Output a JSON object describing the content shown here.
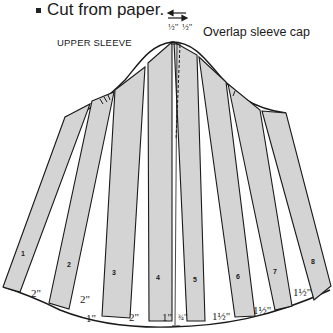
{
  "note": {
    "text": "Cut from paper.",
    "bullet": "square"
  },
  "diagram": {
    "title": "UPPER SLEEVE",
    "overlap_label": "Overlap sleeve cap",
    "overlap_amounts": [
      "½\"",
      "½\""
    ],
    "strip_fill": "#d4d4d4",
    "line_color": "#1a1a1a",
    "strips": [
      {
        "id": "1",
        "label": "1"
      },
      {
        "id": "2",
        "label": "2"
      },
      {
        "id": "3",
        "label": "3"
      },
      {
        "id": "4",
        "label": "4"
      },
      {
        "id": "5",
        "label": "5"
      },
      {
        "id": "6",
        "label": "6"
      },
      {
        "id": "7",
        "label": "7"
      },
      {
        "id": "8",
        "label": "8"
      }
    ],
    "spread_labels": [
      {
        "between": "1-2",
        "text": "2\""
      },
      {
        "between": "2-3 upper",
        "text": "2\""
      },
      {
        "between": "2-3 lower",
        "text": "1\""
      },
      {
        "between": "3-4",
        "text": "2\""
      },
      {
        "between": "4-center",
        "text": "1\""
      },
      {
        "between": "center-5",
        "text": "¾\""
      },
      {
        "between": "5-6",
        "text": "1½\""
      },
      {
        "between": "6-7",
        "text": "1½\""
      },
      {
        "between": "7-8",
        "text": "1½\""
      }
    ]
  }
}
